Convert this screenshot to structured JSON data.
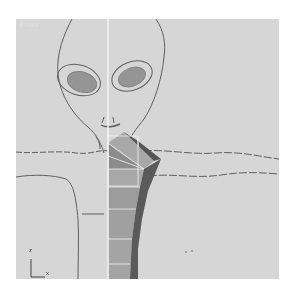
{
  "viewport": {
    "label": "Front",
    "background": "#d6d6d6",
    "mirror_axis_color": "#f4f4f4",
    "mesh_colors": {
      "light_face": "#a8a8a8",
      "mid_face": "#8c8c8c",
      "dark_edge": "#555555",
      "wire": "#f0f0f0"
    },
    "sketch_color": "#4a4a4a"
  },
  "axis_gizmo": {
    "vertical_label": "z",
    "horizontal_label": "x"
  }
}
